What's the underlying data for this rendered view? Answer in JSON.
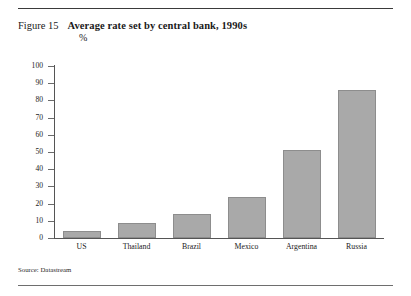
{
  "figure": {
    "number": "Figure 15",
    "title": "Average rate set by central bank, 1990s",
    "unit": "%"
  },
  "source": "Source: Datastream",
  "colors": {
    "bar_fill": "#a9a9a9",
    "bar_stroke": "#8d8d8d",
    "axis": "#555555",
    "text": "#1a1a1a",
    "rule_top": "#3a3a3a",
    "rule_bottom": "#6e6e6e"
  },
  "chart_data": {
    "type": "bar",
    "title": "Average rate set by central bank, 1990s",
    "subtitle": "%",
    "xlabel": "",
    "ylabel": "%",
    "ylim": [
      0,
      100
    ],
    "yticks": [
      0,
      10,
      20,
      30,
      40,
      50,
      60,
      70,
      80,
      90,
      100
    ],
    "ytick_labels": [
      "0",
      "10",
      "20",
      "30",
      "40",
      "50",
      "60",
      "70",
      "80",
      "90",
      "100"
    ],
    "grid": false,
    "legend": false,
    "categories": [
      "US",
      "Thailand",
      "Brazil",
      "Mexico",
      "Argentina",
      "Russia"
    ],
    "values": [
      4,
      9,
      14,
      24,
      51,
      86
    ],
    "source": "Source: Datastream"
  }
}
